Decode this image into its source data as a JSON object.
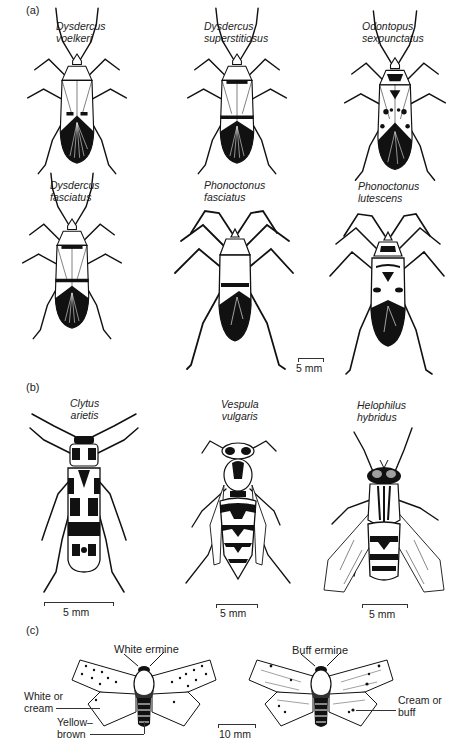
{
  "figure": {
    "panels": [
      {
        "label": "(a)",
        "species": [
          {
            "genus": "Dysdercus",
            "epithet": "voelkeri"
          },
          {
            "genus": "Dysdercus",
            "epithet": "superstitiosus"
          },
          {
            "genus": "Odontopus",
            "epithet": "sexpunctatus"
          },
          {
            "genus": "Dysdercus",
            "epithet": "fasciatus"
          },
          {
            "genus": "Phonoctonus",
            "epithet": "fasciatus"
          },
          {
            "genus": "Phonoctonus",
            "epithet": "lutescens"
          }
        ],
        "scale": "5 mm"
      },
      {
        "label": "(b)",
        "species": [
          {
            "genus": "Clytus",
            "epithet": "arietis",
            "scale": "5 mm"
          },
          {
            "genus": "Vespula",
            "epithet": "vulgaris",
            "scale": "5 mm"
          },
          {
            "genus": "Helophilus",
            "epithet": "hybridus",
            "scale": "5 mm"
          }
        ]
      },
      {
        "label": "(c)",
        "moths": [
          {
            "name": "White ermine"
          },
          {
            "name": "Buff ermine"
          }
        ],
        "annotations": {
          "white_or": "White or",
          "cream": "cream",
          "yellow": "Yellow–",
          "brown": "brown",
          "cream_or": "Cream or",
          "buff": "buff"
        },
        "scale": "10 mm"
      }
    ],
    "colors": {
      "ink": "#111111",
      "paper": "#ffffff"
    }
  }
}
